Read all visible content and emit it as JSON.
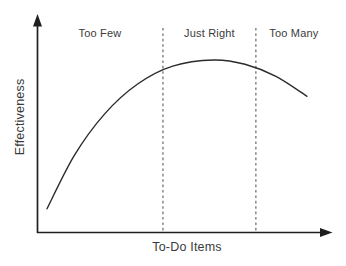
{
  "colors": {
    "background": "#ffffff",
    "axis": "#1f1f1f",
    "curve": "#2b2b2b",
    "divider": "#5a5a5a",
    "text": "#3b3b3b"
  },
  "chart_data": {
    "type": "line",
    "title": "",
    "xlabel": "To-Do Items",
    "ylabel": "Effectiveness",
    "x_range_pct": [
      0,
      100
    ],
    "y_range_pct": [
      0,
      100
    ],
    "grid": false,
    "axes_have_arrows": true,
    "tick_labels": "none",
    "series": [
      {
        "name": "effectiveness-curve",
        "points": [
          [
            3.4,
            14
          ],
          [
            12.7,
            45
          ],
          [
            23,
            69
          ],
          [
            34,
            86
          ],
          [
            46,
            96.5
          ],
          [
            60,
            100
          ],
          [
            70.5,
            97.5
          ],
          [
            81,
            90.5
          ],
          [
            91.5,
            79
          ]
        ]
      }
    ],
    "zone_dividers_x": [
      42.7,
      74.2
    ],
    "zones": [
      {
        "label": "Too Few",
        "x_range": [
          0,
          42.7
        ]
      },
      {
        "label": "Just Right",
        "x_range": [
          42.7,
          74.2
        ]
      },
      {
        "label": "Too Many",
        "x_range": [
          74.2,
          100
        ]
      }
    ]
  }
}
